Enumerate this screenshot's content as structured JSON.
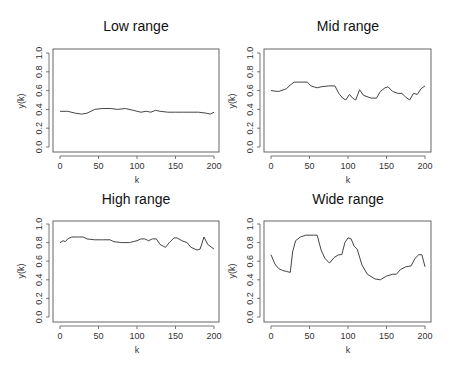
{
  "chart_data": [
    {
      "type": "line",
      "title": "Low range",
      "xlabel": "k",
      "ylabel": "y(k)",
      "xlim": [
        0,
        200
      ],
      "ylim": [
        0,
        1
      ],
      "xticks": [
        0,
        50,
        100,
        150,
        200
      ],
      "yticks": [
        "0.0",
        "0.2",
        "0.4",
        "0.6",
        "0.8",
        "1.0"
      ],
      "grid": false,
      "x": [
        0,
        10,
        20,
        28,
        35,
        45,
        55,
        65,
        75,
        85,
        95,
        105,
        112,
        118,
        124,
        130,
        140,
        150,
        160,
        170,
        180,
        190,
        195,
        200
      ],
      "values": [
        0.38,
        0.38,
        0.36,
        0.35,
        0.36,
        0.4,
        0.41,
        0.41,
        0.4,
        0.41,
        0.39,
        0.37,
        0.38,
        0.37,
        0.39,
        0.38,
        0.37,
        0.37,
        0.37,
        0.37,
        0.37,
        0.36,
        0.35,
        0.37
      ]
    },
    {
      "type": "line",
      "title": "Mid range",
      "xlabel": "k",
      "ylabel": "y(k)",
      "xlim": [
        0,
        200
      ],
      "ylim": [
        0,
        1
      ],
      "xticks": [
        0,
        50,
        100,
        150,
        200
      ],
      "yticks": [
        "0.0",
        "0.2",
        "0.4",
        "0.6",
        "0.8",
        "1.0"
      ],
      "grid": false,
      "x": [
        0,
        10,
        20,
        25,
        30,
        40,
        47,
        52,
        60,
        65,
        75,
        83,
        88,
        93,
        97,
        102,
        106,
        110,
        115,
        120,
        130,
        137,
        142,
        148,
        152,
        158,
        165,
        170,
        175,
        180,
        185,
        190,
        195,
        200
      ],
      "values": [
        0.6,
        0.59,
        0.62,
        0.66,
        0.69,
        0.69,
        0.69,
        0.65,
        0.63,
        0.64,
        0.65,
        0.65,
        0.57,
        0.52,
        0.5,
        0.56,
        0.52,
        0.5,
        0.61,
        0.55,
        0.52,
        0.52,
        0.59,
        0.63,
        0.64,
        0.59,
        0.57,
        0.57,
        0.53,
        0.5,
        0.57,
        0.56,
        0.62,
        0.65
      ]
    },
    {
      "type": "line",
      "title": "High range",
      "xlabel": "k",
      "ylabel": "y(k)",
      "xlim": [
        0,
        200
      ],
      "ylim": [
        0,
        1
      ],
      "xticks": [
        0,
        50,
        100,
        150,
        200
      ],
      "yticks": [
        "0.0",
        "0.2",
        "0.4",
        "0.6",
        "0.8",
        "1.0"
      ],
      "grid": false,
      "x": [
        0,
        4,
        7,
        10,
        15,
        25,
        30,
        35,
        45,
        55,
        65,
        70,
        80,
        90,
        95,
        100,
        105,
        110,
        115,
        120,
        125,
        130,
        137,
        142,
        148,
        152,
        158,
        165,
        170,
        178,
        182,
        187,
        192,
        200
      ],
      "values": [
        0.8,
        0.82,
        0.81,
        0.84,
        0.86,
        0.86,
        0.86,
        0.84,
        0.83,
        0.83,
        0.83,
        0.81,
        0.8,
        0.8,
        0.81,
        0.82,
        0.84,
        0.84,
        0.82,
        0.84,
        0.84,
        0.78,
        0.75,
        0.8,
        0.85,
        0.85,
        0.82,
        0.8,
        0.75,
        0.72,
        0.73,
        0.86,
        0.78,
        0.73
      ]
    },
    {
      "type": "line",
      "title": "Wide range",
      "xlabel": "k",
      "ylabel": "y(k)",
      "xlim": [
        0,
        200
      ],
      "ylim": [
        0,
        1
      ],
      "xticks": [
        0,
        50,
        100,
        150,
        200
      ],
      "yticks": [
        "0.0",
        "0.2",
        "0.4",
        "0.6",
        "0.8",
        "1.0"
      ],
      "grid": false,
      "x": [
        0,
        5,
        10,
        15,
        20,
        25,
        28,
        32,
        38,
        45,
        55,
        60,
        65,
        70,
        76,
        82,
        88,
        92,
        96,
        100,
        104,
        108,
        112,
        118,
        125,
        135,
        142,
        150,
        158,
        163,
        168,
        175,
        182,
        187,
        192,
        196,
        200
      ],
      "values": [
        0.67,
        0.57,
        0.52,
        0.5,
        0.49,
        0.48,
        0.7,
        0.82,
        0.86,
        0.88,
        0.88,
        0.88,
        0.72,
        0.63,
        0.58,
        0.64,
        0.67,
        0.67,
        0.8,
        0.85,
        0.84,
        0.76,
        0.73,
        0.56,
        0.46,
        0.41,
        0.4,
        0.44,
        0.46,
        0.46,
        0.51,
        0.54,
        0.55,
        0.63,
        0.67,
        0.67,
        0.54
      ]
    }
  ],
  "panels": [
    {
      "title": "Low range",
      "xlabel": "k",
      "ylabel": "y(k)"
    },
    {
      "title": "Mid range",
      "xlabel": "k",
      "ylabel": "y(k)"
    },
    {
      "title": "High range",
      "xlabel": "k",
      "ylabel": "y(k)"
    },
    {
      "title": "Wide range",
      "xlabel": "k",
      "ylabel": "y(k)"
    }
  ]
}
